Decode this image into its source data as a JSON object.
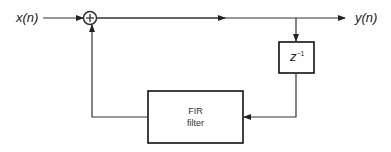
{
  "diagram": {
    "type": "block-diagram",
    "input_label": "x(n)",
    "output_label": "y(n)",
    "summing_junction": {
      "symbol": "+"
    },
    "delay_block": {
      "base": "z",
      "exponent": "−1"
    },
    "fir_block": {
      "line1": "FIR",
      "line2": "filter"
    },
    "connections": [
      {
        "from": "x(n)",
        "to": "summing-junction"
      },
      {
        "from": "summing-junction",
        "to": "y(n)"
      },
      {
        "from": "output-line",
        "to": "delay-block"
      },
      {
        "from": "delay-block",
        "to": "fir-block"
      },
      {
        "from": "fir-block",
        "to": "summing-junction"
      }
    ]
  }
}
